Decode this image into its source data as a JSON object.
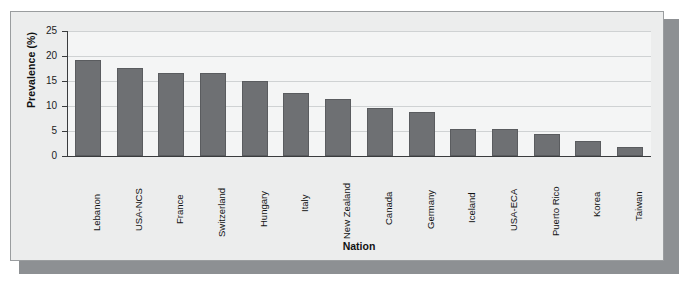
{
  "chart_data": {
    "type": "bar",
    "title": "",
    "subtitle": "",
    "xlabel": "Nation",
    "ylabel": "Prevalence (%)",
    "categories": [
      "Lebanon",
      "USA-NCS",
      "France",
      "Switzerland",
      "Hungary",
      "Italy",
      "New Zealand",
      "Canada",
      "Germany",
      "Iceland",
      "USA-ECA",
      "Puerto Rico",
      "Korea",
      "Taiwan"
    ],
    "values": [
      19.2,
      17.7,
      16.6,
      16.6,
      15.1,
      12.6,
      11.5,
      9.6,
      8.8,
      5.4,
      5.4,
      4.5,
      3.0,
      1.8
    ],
    "ylim": [
      0,
      25
    ],
    "ytick_values": [
      0,
      5,
      10,
      15,
      20,
      25
    ],
    "ytick_labels": [
      "0",
      "5",
      "10",
      "15",
      "20",
      "25"
    ],
    "grid": true,
    "grid_axis": "y",
    "legend": false,
    "legend_position": "none",
    "xtick_rotation": 90,
    "bar_color": "#6e7073",
    "bar_edge_color": "#5a5c5f",
    "plot_background": "#f4f5f5",
    "figure_background": "#eceded",
    "gridline_color": "#cfd2d3",
    "axis_color": "#3a3c3e",
    "frame_border_color": "#9a9d9f",
    "shadow_color": "#8d9093"
  }
}
